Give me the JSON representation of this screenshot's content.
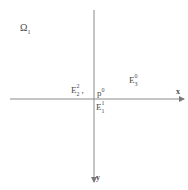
{
  "diagram": {
    "type": "coordinate-axes-diagram",
    "region_label": {
      "base": "Ω",
      "sub": "1"
    },
    "axes": {
      "horizontal": {
        "label": "x",
        "x1": 10,
        "x2": 185,
        "y": 99,
        "arrow": "right"
      },
      "vertical": {
        "label": "y",
        "y1": 10,
        "y2": 183,
        "x": 94,
        "arrow": "down"
      },
      "stroke_color": "#8a8a8a"
    },
    "labels": [
      {
        "id": "E2-2",
        "base": "E",
        "sup": "2",
        "sub": "2",
        "suffix": ",",
        "x": 71,
        "y": 86
      },
      {
        "id": "p0",
        "base": "p",
        "sup": "0",
        "sub": "",
        "suffix": "",
        "x": 97,
        "y": 89
      },
      {
        "id": "E1-1",
        "base": "E",
        "sup": "1",
        "sub": "1",
        "suffix": "",
        "x": 96,
        "y": 102
      },
      {
        "id": "E0-3",
        "base": "E",
        "sup": "0",
        "sub": "3",
        "suffix": "",
        "x": 128,
        "y": 75
      }
    ]
  }
}
